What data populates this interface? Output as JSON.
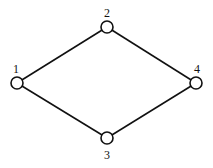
{
  "graph": {
    "nodes": [
      {
        "id": "1",
        "label": "1",
        "x": 17,
        "y": 83,
        "lx": 16,
        "ly": 73
      },
      {
        "id": "2",
        "label": "2",
        "x": 107,
        "y": 27,
        "lx": 107,
        "ly": 17
      },
      {
        "id": "3",
        "label": "3",
        "x": 107,
        "y": 138,
        "lx": 107,
        "ly": 159
      },
      {
        "id": "4",
        "label": "4",
        "x": 196,
        "y": 83,
        "lx": 197,
        "ly": 73
      }
    ],
    "edges": [
      {
        "from": "1",
        "to": "2"
      },
      {
        "from": "1",
        "to": "3"
      },
      {
        "from": "2",
        "to": "4"
      },
      {
        "from": "3",
        "to": "4"
      }
    ],
    "node_radius": 6
  }
}
